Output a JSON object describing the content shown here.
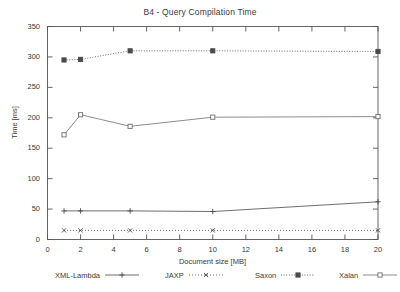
{
  "chart_data": {
    "type": "line",
    "title": "B4 - Query Compilation Time",
    "xlabel": "Document size [MB]",
    "ylabel": "Time [ms]",
    "x": [
      1,
      2,
      5,
      10,
      20
    ],
    "xlim": [
      0,
      20
    ],
    "ylim": [
      0,
      350
    ],
    "xticks": [
      0,
      2,
      4,
      6,
      8,
      10,
      12,
      14,
      16,
      18,
      20
    ],
    "yticks": [
      0,
      50,
      100,
      150,
      200,
      250,
      300,
      350
    ],
    "grid": false,
    "legend_position": "below",
    "series": [
      {
        "name": "XML-Lambda",
        "values": [
          47,
          47,
          47,
          46,
          62
        ],
        "marker": "plus",
        "line": "solid",
        "color": "#4a4a4a"
      },
      {
        "name": "JAXP",
        "values": [
          15,
          15,
          15,
          15,
          15
        ],
        "marker": "cross",
        "line": "dotted",
        "color": "#4a4a4a"
      },
      {
        "name": "Saxon",
        "values": [
          295,
          296,
          310,
          310,
          309
        ],
        "marker": "filled-square",
        "line": "dashdot",
        "color": "#4a4a4a"
      },
      {
        "name": "Xalan",
        "values": [
          172,
          205,
          186,
          201,
          202
        ],
        "marker": "open-square",
        "line": "solid",
        "color": "#6e6e6e"
      }
    ]
  },
  "axis": {
    "ytick_labels": [
      "0",
      "50",
      "100",
      "150",
      "200",
      "250",
      "300",
      "350"
    ],
    "xtick_labels": [
      "0",
      "2",
      "4",
      "6",
      "8",
      "10",
      "12",
      "14",
      "16",
      "18",
      "20"
    ]
  },
  "legend": {
    "entries": [
      {
        "label": "XML-Lambda"
      },
      {
        "label": "JAXP"
      },
      {
        "label": "Saxon"
      },
      {
        "label": "Xalan"
      }
    ]
  },
  "colors": {
    "frame": "#555555",
    "text": "#3a3a3a",
    "background": "#ffffff"
  }
}
